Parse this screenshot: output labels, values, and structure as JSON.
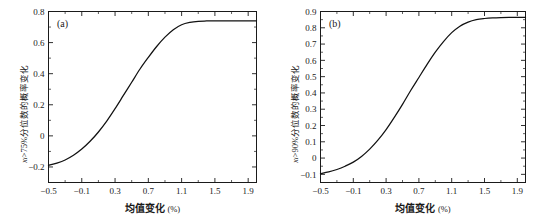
{
  "figure": {
    "panel_count": 2,
    "background": "#ffffff",
    "curve_color": "#111111",
    "axis_color": "#1a1a1a"
  },
  "chart_data": [
    {
      "type": "line",
      "panel": "(a)",
      "title": "",
      "xlabel": "均值变化 (%)",
      "ylabel": "xᵢ>75%分位数的概率变化",
      "ylabel_parts": {
        "var": "x",
        "sub": "i",
        "rest": ">75%分位数的概率变化"
      },
      "xlim": [
        -0.5,
        2.0
      ],
      "ylim": [
        -0.3,
        0.8
      ],
      "xticks": [
        "-0.5",
        "-0.1",
        "0.3",
        "0.7",
        "1.1",
        "1.5",
        "1.9"
      ],
      "xtick_values": [
        -0.5,
        -0.1,
        0.3,
        0.7,
        1.1,
        1.5,
        1.9
      ],
      "yticks": [
        "0.8",
        "0.6",
        "0.4",
        "0.2",
        "0",
        "-0.2"
      ],
      "ytick_values": [
        0.8,
        0.6,
        0.4,
        0.2,
        0,
        -0.2
      ],
      "grid": false,
      "legend": "none",
      "x": [
        -0.5,
        -0.4,
        -0.3,
        -0.2,
        -0.1,
        0.0,
        0.1,
        0.2,
        0.3,
        0.4,
        0.5,
        0.6,
        0.7,
        0.8,
        0.9,
        1.0,
        1.1,
        1.2,
        1.3,
        1.4,
        1.5,
        1.6,
        1.7,
        1.8,
        1.9,
        2.0
      ],
      "y": [
        -0.19,
        -0.175,
        -0.155,
        -0.125,
        -0.085,
        -0.035,
        0.025,
        0.095,
        0.175,
        0.26,
        0.345,
        0.43,
        0.505,
        0.575,
        0.635,
        0.683,
        0.715,
        0.73,
        0.737,
        0.739,
        0.74,
        0.74,
        0.74,
        0.74,
        0.74,
        0.74
      ]
    },
    {
      "type": "line",
      "panel": "(b)",
      "title": "",
      "xlabel": "均值变化 (%)",
      "ylabel": "xᵢ>90%分位数的概率变化",
      "ylabel_parts": {
        "var": "x",
        "sub": "i",
        "rest": ">90%分位数的概率变化"
      },
      "xlim": [
        -0.5,
        2.0
      ],
      "ylim": [
        -0.15,
        0.9
      ],
      "xticks": [
        "-0.5",
        "-0.1",
        "0.3",
        "0.7",
        "1.1",
        "1.5",
        "1.9"
      ],
      "xtick_values": [
        -0.5,
        -0.1,
        0.3,
        0.7,
        1.1,
        1.5,
        1.9
      ],
      "yticks": [
        "0.9",
        "0.8",
        "0.7",
        "0.6",
        "0.5",
        "0.4",
        "0.3",
        "0.2",
        "0.1",
        "0",
        "-0.1"
      ],
      "ytick_values": [
        0.9,
        0.8,
        0.7,
        0.6,
        0.5,
        0.4,
        0.3,
        0.2,
        0.1,
        0,
        -0.1
      ],
      "grid": false,
      "legend": "none",
      "x": [
        -0.5,
        -0.4,
        -0.3,
        -0.2,
        -0.1,
        0.0,
        0.1,
        0.2,
        0.3,
        0.4,
        0.5,
        0.6,
        0.7,
        0.8,
        0.9,
        1.0,
        1.1,
        1.2,
        1.3,
        1.4,
        1.5,
        1.6,
        1.7,
        1.8,
        1.9,
        2.0
      ],
      "y": [
        -0.095,
        -0.085,
        -0.07,
        -0.05,
        -0.025,
        0.01,
        0.055,
        0.11,
        0.175,
        0.25,
        0.33,
        0.415,
        0.495,
        0.575,
        0.65,
        0.715,
        0.77,
        0.81,
        0.835,
        0.85,
        0.857,
        0.861,
        0.863,
        0.864,
        0.864,
        0.864
      ]
    }
  ]
}
